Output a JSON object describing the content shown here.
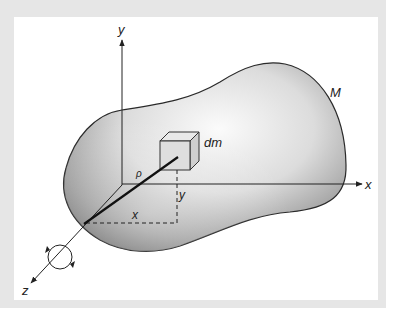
{
  "diagram": {
    "body_label": "M",
    "element_label": "dm",
    "radius_label": "ρ",
    "axes": {
      "x_label": "x",
      "y_label": "y",
      "z_label": "z"
    },
    "coordinate_labels": {
      "x_distance": "x",
      "y_distance": "y"
    },
    "rotation_indicator": "rotation-about-z-axis",
    "colors": {
      "frame": "#e6e6e6",
      "panel": "#ffffff",
      "outline": "#2a2a2a",
      "body_light": "#f4f4f4",
      "body_dark": "#7a7a7a"
    }
  }
}
